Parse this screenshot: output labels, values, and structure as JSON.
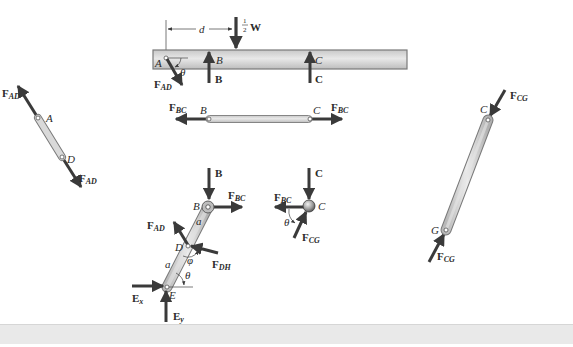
{
  "figure": {
    "colors": {
      "arrow": "#3a3a3a",
      "member_fill": "#d8d8d8",
      "member_edge": "#7a7a7a",
      "beam_fill": "#dcdcdc",
      "text": "#2b2b2b",
      "bottom_band": "#e9e9e9"
    }
  },
  "beam": {
    "dimension_label": "d",
    "load_label_frac": "1/2",
    "load_label_num": "1",
    "load_label_den": "2",
    "load_label_sym": "W",
    "point_A": "A",
    "point_B": "B",
    "point_C": "C",
    "force_B": "B",
    "force_C": "C",
    "force_AD_main": "F",
    "force_AD_sub": "AD",
    "angle": "θ"
  },
  "link_AD": {
    "point_A": "A",
    "point_D": "D",
    "force_top_main": "F",
    "force_top_sub": "AD",
    "force_bottom_main": "F",
    "force_bottom_sub": "AD"
  },
  "link_BC": {
    "point_B": "B",
    "point_C": "C",
    "force_left_main": "F",
    "force_left_sub": "BC",
    "force_right_main": "F",
    "force_right_sub": "BC"
  },
  "member_BDE": {
    "force_B": "B",
    "point_B": "B",
    "force_BC_main": "F",
    "force_BC_sub": "BC",
    "length_upper": "a",
    "length_lower": "a",
    "force_AD_main": "F",
    "force_AD_sub": "AD",
    "point_D": "D",
    "angle_phi": "φ",
    "force_DH_main": "F",
    "force_DH_sub": "DH",
    "angle_theta": "θ",
    "point_E": "E",
    "force_Ex_main": "E",
    "force_Ex_sub": "x",
    "force_Ey_main": "E",
    "force_Ey_sub": "y"
  },
  "joint_C": {
    "force_C": "C",
    "point_C": "C",
    "force_BC_main": "F",
    "force_BC_sub": "BC",
    "angle": "θ",
    "force_CG_main": "F",
    "force_CG_sub": "CG"
  },
  "link_CG": {
    "point_C": "C",
    "point_G": "G",
    "force_top_main": "F",
    "force_top_sub": "CG",
    "force_bottom_main": "F",
    "force_bottom_sub": "CG"
  }
}
